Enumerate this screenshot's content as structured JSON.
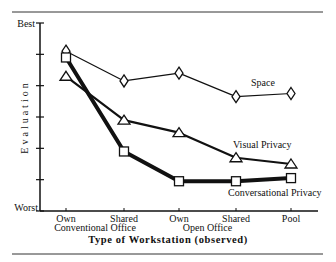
{
  "chart_data": {
    "type": "line",
    "title": "",
    "xlabel": "Type of Workstation (observed)",
    "ylabel": "Evaluation",
    "y_top_label": "Best",
    "y_bottom_label": "Worst",
    "ylim": [
      0,
      6
    ],
    "y_ticks": [
      0,
      1,
      2,
      3,
      4,
      5,
      6
    ],
    "categories": [
      "Own",
      "Shared",
      "Own",
      "Shared",
      "Pool"
    ],
    "category_groups": [
      {
        "label": "Conventional Office",
        "spans": [
          0,
          1
        ]
      },
      {
        "label": "Open Office",
        "spans": [
          2,
          3
        ]
      }
    ],
    "grid": false,
    "series": [
      {
        "name": "Space",
        "marker": "diamond",
        "weight": "thin",
        "values": [
          5.1,
          4.15,
          4.4,
          3.65,
          3.75
        ]
      },
      {
        "name": "Visual Privacy",
        "marker": "triangle",
        "weight": "medium",
        "values": [
          4.3,
          2.9,
          2.5,
          1.7,
          1.5
        ]
      },
      {
        "name": "Conversational Privacy",
        "marker": "square",
        "weight": "heavy",
        "values": [
          4.9,
          1.9,
          0.95,
          0.95,
          1.05
        ]
      }
    ]
  }
}
